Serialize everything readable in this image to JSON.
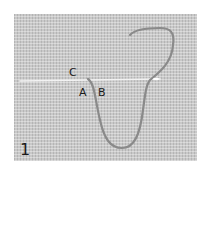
{
  "figure": {
    "panel_number": "1",
    "labels": {
      "a": "A",
      "b": "B",
      "c": "C"
    },
    "colors": {
      "fabric": "#c9c9c9",
      "thread": "#8a8a8a",
      "needle": "#f2f2f2",
      "text": "#1a1a1a"
    }
  }
}
